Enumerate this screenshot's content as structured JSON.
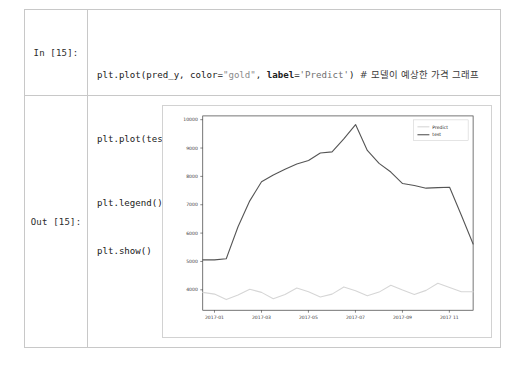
{
  "notebook": {
    "input_prompt": "In [15]:",
    "output_prompt": "Out [15]:",
    "code": {
      "line1": {
        "a": "plt.plot(pred_y, color=",
        "str1": "\"gold\"",
        "b": ", ",
        "kw": "label",
        "c": "=",
        "str2": "'Predict'",
        "d": ") ",
        "comment": "# 모델이 예상한 가격 그래프"
      },
      "line2": {
        "a": "plt.plot(test_y, color=",
        "str1": "\"green\"",
        "b": ", ",
        "kw": "label",
        "c": "=",
        "str2": "'test'",
        "d": ") ",
        "comment": "# 실제 가격 그래프"
      },
      "line3": "plt.legend()",
      "line4": "plt.show()"
    }
  },
  "chart_data": {
    "type": "line",
    "title": "",
    "xlabel": "",
    "ylabel": "",
    "grid": false,
    "legend_position": "upper right",
    "xlim": [
      0,
      23
    ],
    "ylim": [
      3500,
      10250
    ],
    "ytick_labels": [
      "10000",
      "9000",
      "8000",
      "7000",
      "6000",
      "5000",
      "4000"
    ],
    "ytick_values": [
      10000,
      9000,
      8000,
      7000,
      6000,
      5000,
      4000
    ],
    "xtick_labels": [
      "2017-01",
      "2017-03",
      "2017-05",
      "2017-07",
      "2017-09",
      "2017 11"
    ],
    "xtick_values": [
      1,
      5,
      9,
      13,
      17,
      21
    ],
    "series": [
      {
        "name": "Predict",
        "color": "#d6d6d6",
        "x": [
          0,
          1,
          2,
          3,
          4,
          5,
          6,
          7,
          8,
          9,
          10,
          11,
          12,
          13,
          14,
          15,
          16,
          17,
          18,
          19,
          20,
          21,
          22,
          23
        ],
        "values": [
          4120,
          4060,
          3870,
          4030,
          4230,
          4120,
          3900,
          4050,
          4270,
          4140,
          3960,
          4060,
          4310,
          4180,
          4000,
          4130,
          4370,
          4200,
          4050,
          4190,
          4440,
          4290,
          4140,
          4140
        ]
      },
      {
        "name": "test",
        "color": "#555555",
        "x": [
          0,
          1,
          2,
          3,
          4,
          5,
          6,
          7,
          8,
          9,
          10,
          11,
          12,
          13,
          14,
          15,
          16,
          17,
          18,
          19,
          20,
          21,
          22,
          23
        ],
        "values": [
          5250,
          5250,
          5290,
          6400,
          7300,
          7960,
          8200,
          8400,
          8580,
          8700,
          8960,
          9000,
          9450,
          9950,
          9050,
          8600,
          8300,
          7900,
          7830,
          7740,
          7760,
          7770,
          6800,
          5800
        ]
      }
    ]
  }
}
